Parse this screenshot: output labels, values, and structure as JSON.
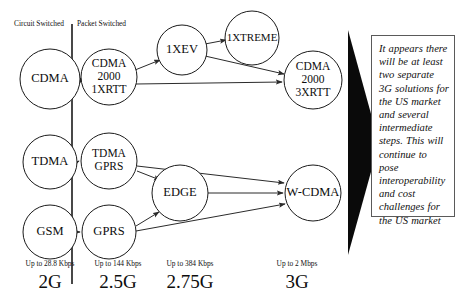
{
  "diagram": {
    "columns": [
      {
        "id": "circuit",
        "label": "Circuit Switched"
      },
      {
        "id": "packet",
        "label": "Packet Switched"
      }
    ],
    "nodes": [
      {
        "id": "cdma",
        "label": "CDMA",
        "lines": [
          "CDMA"
        ],
        "cx": 50,
        "cy": 79,
        "r": 30
      },
      {
        "id": "cdma2000-1x",
        "label": "CDMA 2000 1XRTT",
        "lines": [
          "CDMA",
          "2000",
          "1XRTT"
        ],
        "cx": 109,
        "cy": 77,
        "r": 28
      },
      {
        "id": "1xev",
        "label": "1XEV",
        "lines": [
          "1XEV"
        ],
        "cx": 182,
        "cy": 50,
        "r": 25
      },
      {
        "id": "1xtreme",
        "label": "1XTREME",
        "lines": [
          "1XTREME"
        ],
        "cx": 252,
        "cy": 38,
        "r": 27
      },
      {
        "id": "cdma2000-3x",
        "label": "CDMA 2000 3XRTT",
        "lines": [
          "CDMA",
          "2000",
          "3XRTT"
        ],
        "cx": 313,
        "cy": 80,
        "r": 29
      },
      {
        "id": "tdma",
        "label": "TDMA",
        "lines": [
          "TDMA"
        ],
        "cx": 50,
        "cy": 162,
        "r": 27
      },
      {
        "id": "tdma-gprs",
        "label": "TDMA GPRS",
        "lines": [
          "TDMA",
          "GPRS"
        ],
        "cx": 109,
        "cy": 161,
        "r": 28
      },
      {
        "id": "gsm",
        "label": "GSM",
        "lines": [
          "GSM"
        ],
        "cx": 50,
        "cy": 232,
        "r": 27
      },
      {
        "id": "gprs",
        "label": "GPRS",
        "lines": [
          "GPRS"
        ],
        "cx": 109,
        "cy": 232,
        "r": 27
      },
      {
        "id": "edge",
        "label": "EDGE",
        "lines": [
          "EDGE"
        ],
        "cx": 180,
        "cy": 193,
        "r": 28
      },
      {
        "id": "wcdma",
        "label": "W-CDMA",
        "lines": [
          "W-CDMA"
        ],
        "cx": 313,
        "cy": 193,
        "r": 28
      }
    ],
    "edges": [
      {
        "from": "cdma",
        "to": "cdma2000-1x",
        "arrow": true
      },
      {
        "from": "cdma2000-1x",
        "to": "1xev",
        "arrow": true
      },
      {
        "from": "cdma2000-1x",
        "to": "cdma2000-3x",
        "arrow": true
      },
      {
        "from": "1xev",
        "to": "1xtreme",
        "arrow": true
      },
      {
        "from": "1xev",
        "to": "cdma2000-3x",
        "arrow": true
      },
      {
        "from": "tdma",
        "to": "tdma-gprs",
        "arrow": true
      },
      {
        "from": "tdma-gprs",
        "to": "edge",
        "arrow": true
      },
      {
        "from": "tdma-gprs",
        "to": "wcdma",
        "arrow": true
      },
      {
        "from": "gsm",
        "to": "gprs",
        "arrow": true
      },
      {
        "from": "gprs",
        "to": "edge",
        "arrow": true
      },
      {
        "from": "gprs",
        "to": "wcdma",
        "arrow": true
      },
      {
        "from": "edge",
        "to": "wcdma",
        "arrow": true
      }
    ],
    "generations": [
      {
        "id": "2g",
        "rate": "Up to 28.8 Kbps",
        "label": "2G",
        "x": 50,
        "rate_y": 266,
        "label_y": 288
      },
      {
        "id": "2_5g",
        "rate": "Up to 144 Kbps",
        "label": "2.5G",
        "x": 118,
        "rate_y": 266,
        "label_y": 288
      },
      {
        "id": "2_75g",
        "rate": "Up to 384 Kbps",
        "label": "2.75G",
        "x": 190,
        "rate_y": 266,
        "label_y": 288
      },
      {
        "id": "3g",
        "rate": "Up to 2 Mbps",
        "label": "3G",
        "x": 297,
        "rate_y": 266,
        "label_y": 288
      }
    ]
  },
  "callout": {
    "text": "It appears there will be at least two separate 3G solutions for the US market and several intermediate steps.  This will continue to pose interoperability and cost challenges for the US market"
  },
  "colors": {
    "stroke": "#1a1a1a",
    "triangle": "#0a0a0a",
    "box_border": "#5a5a5a",
    "background": "#ffffff"
  }
}
